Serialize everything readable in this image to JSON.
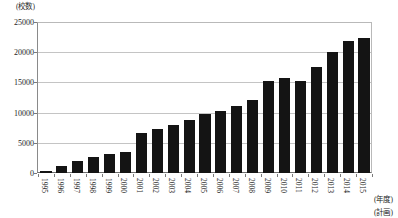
{
  "chart_data": {
    "type": "bar",
    "title": "",
    "subtitle": "",
    "unit_label": "(校数)",
    "xlabel": "(年度)",
    "xlabel_note": "(計画)",
    "ylabel": "",
    "ylim": [
      0,
      25000
    ],
    "ytick_values": [
      0,
      5000,
      10000,
      15000,
      20000,
      25000
    ],
    "ytick_labels": [
      "0",
      "5000",
      "10000",
      "15000",
      "20000",
      "25000"
    ],
    "grid": true,
    "legend": "none",
    "bar_color": "#141414",
    "grid_color": "#c4c4c4",
    "axis_color": "#6f6f6f",
    "categories": [
      "1995",
      "1996",
      "1997",
      "1998",
      "1999",
      "2000",
      "2001",
      "2002",
      "2003",
      "2004",
      "2005",
      "2006",
      "2007",
      "2008",
      "2009",
      "2010",
      "2011",
      "2012",
      "2013",
      "2014",
      "2015"
    ],
    "values": [
      300,
      1100,
      2000,
      2700,
      3100,
      3400,
      6600,
      7300,
      8000,
      8800,
      9800,
      10200,
      11100,
      12100,
      15300,
      15700,
      15200,
      17500,
      20000,
      21900,
      22300
    ],
    "annotations": [
      {
        "text": "(年度)",
        "position": "x-axis-right"
      },
      {
        "text": "(計画)",
        "position": "below-last-category"
      },
      {
        "text": "(校数)",
        "position": "y-axis-top"
      }
    ]
  }
}
